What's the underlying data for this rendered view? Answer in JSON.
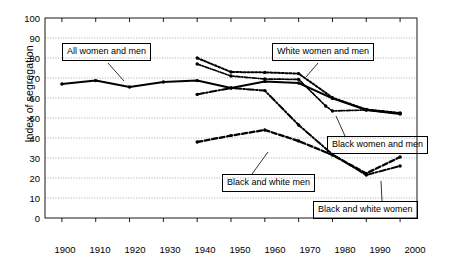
{
  "chart_data": {
    "type": "line",
    "title": "",
    "xlabel": "",
    "ylabel": "Index of segregation",
    "xlim": [
      1895,
      2005
    ],
    "ylim": [
      0,
      100
    ],
    "ytick_step": 10,
    "grid": true,
    "legend_position": "inline-callouts",
    "x_ticks": [
      "1900",
      "1910",
      "1920",
      "1930",
      "1940",
      "1950",
      "1960",
      "1970",
      "1980",
      "1990",
      "2000"
    ],
    "y_ticks": [
      "0",
      "10",
      "20",
      "30",
      "40",
      "50",
      "60",
      "70",
      "80",
      "90",
      "100"
    ],
    "series": [
      {
        "name": "All women and men",
        "style": "solid",
        "x": [
          1900,
          1910,
          1920,
          1930,
          1940,
          1950,
          1960,
          1970,
          1980,
          1990,
          2000
        ],
        "values": [
          67,
          68.7,
          65.5,
          68,
          68.7,
          65,
          68.3,
          67.5,
          59.8,
          54,
          52
        ]
      },
      {
        "name": "White women and men",
        "style": "dotted",
        "x": [
          1940,
          1950,
          1960,
          1970,
          1980,
          1990,
          2000
        ],
        "values": [
          80,
          73,
          72.8,
          72.2,
          60.2,
          54.3,
          52.5
        ]
      },
      {
        "name": "Black women and men",
        "style": "dash-dot-fine",
        "x": [
          1940,
          1950,
          1960,
          1970,
          1978,
          1980,
          1990,
          2000
        ],
        "values": [
          77,
          71,
          69.5,
          69.3,
          56,
          53.5,
          54,
          52.3
        ]
      },
      {
        "name": "Black and white men",
        "style": "dashed",
        "x": [
          1940,
          1950,
          1960,
          1970,
          1980,
          1990,
          2000
        ],
        "values": [
          38,
          41.2,
          44,
          38.5,
          31.5,
          22.3,
          30.5
        ]
      },
      {
        "name": "Black and white women",
        "style": "dash-dot",
        "x": [
          1940,
          1950,
          1960,
          1970,
          1980,
          1990,
          2000
        ],
        "values": [
          61.8,
          65,
          63.7,
          46.5,
          31.8,
          21.5,
          26
        ]
      }
    ],
    "callouts": [
      {
        "id": "all-women-and-men",
        "label": "All women and men"
      },
      {
        "id": "white-women-and-men",
        "label": "White women and men"
      },
      {
        "id": "black-women-and-men",
        "label": "Black women and men"
      },
      {
        "id": "black-and-white-men",
        "label": "Black and white men"
      },
      {
        "id": "black-and-white-women",
        "label": "Black and white women"
      }
    ],
    "colors": {
      "line": "#000000",
      "grid": "#8a8a8a",
      "axis": "#000000",
      "background": "#ffffff"
    }
  }
}
